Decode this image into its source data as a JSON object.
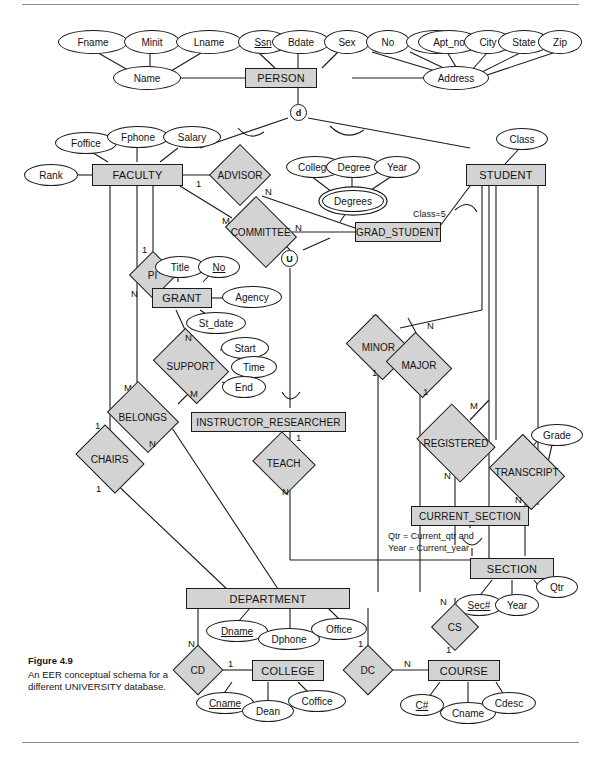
{
  "figure": {
    "number": "Figure 4.9",
    "caption": "An EER conceptual schema for a different UNIVERSITY database."
  },
  "entities": [
    {
      "id": "person",
      "label": "PERSON"
    },
    {
      "id": "faculty",
      "label": "FACULTY"
    },
    {
      "id": "student",
      "label": "STUDENT"
    },
    {
      "id": "grad",
      "label": "GRAD_STUDENT"
    },
    {
      "id": "grant",
      "label": "GRANT"
    },
    {
      "id": "instres",
      "label": "INSTRUCTOR_RESEARCHER"
    },
    {
      "id": "cursec",
      "label": "CURRENT_SECTION"
    },
    {
      "id": "section",
      "label": "SECTION"
    },
    {
      "id": "dept",
      "label": "DEPARTMENT"
    },
    {
      "id": "college",
      "label": "COLLEGE"
    },
    {
      "id": "course",
      "label": "COURSE"
    }
  ],
  "relationships": [
    {
      "id": "advisor",
      "label": "ADVISOR"
    },
    {
      "id": "committee",
      "label": "COMMITTEE"
    },
    {
      "id": "pi",
      "label": "PI"
    },
    {
      "id": "support",
      "label": "SUPPORT"
    },
    {
      "id": "belongs",
      "label": "BELONGS"
    },
    {
      "id": "chairs",
      "label": "CHAIRS"
    },
    {
      "id": "teach",
      "label": "TEACH"
    },
    {
      "id": "minor",
      "label": "MINOR"
    },
    {
      "id": "major",
      "label": "MAJOR"
    },
    {
      "id": "registered",
      "label": "REGISTERED"
    },
    {
      "id": "transcript",
      "label": "TRANSCRIPT"
    },
    {
      "id": "cd",
      "label": "CD"
    },
    {
      "id": "dc",
      "label": "DC"
    },
    {
      "id": "cs",
      "label": "CS"
    }
  ],
  "attributes": [
    {
      "id": "fname",
      "label": "Fname",
      "kind": "simple"
    },
    {
      "id": "minit",
      "label": "Minit",
      "kind": "simple"
    },
    {
      "id": "lname",
      "label": "Lname",
      "kind": "simple"
    },
    {
      "id": "name",
      "label": "Name",
      "kind": "composite"
    },
    {
      "id": "ssn",
      "label": "Ssn",
      "kind": "key"
    },
    {
      "id": "bdate",
      "label": "Bdate",
      "kind": "simple"
    },
    {
      "id": "sex",
      "label": "Sex",
      "kind": "simple"
    },
    {
      "id": "no",
      "label": "No",
      "kind": "simple"
    },
    {
      "id": "street",
      "label": "Street",
      "kind": "simple"
    },
    {
      "id": "apt_no",
      "label": "Apt_no",
      "kind": "simple"
    },
    {
      "id": "city",
      "label": "City",
      "kind": "simple"
    },
    {
      "id": "state",
      "label": "State",
      "kind": "simple"
    },
    {
      "id": "zip",
      "label": "Zip",
      "kind": "simple"
    },
    {
      "id": "address",
      "label": "Address",
      "kind": "composite"
    },
    {
      "id": "foffice",
      "label": "Foffice",
      "kind": "simple"
    },
    {
      "id": "fphone",
      "label": "Fphone",
      "kind": "simple"
    },
    {
      "id": "salary",
      "label": "Salary",
      "kind": "simple"
    },
    {
      "id": "rank",
      "label": "Rank",
      "kind": "simple"
    },
    {
      "id": "college_a",
      "label": "College",
      "kind": "simple"
    },
    {
      "id": "degree",
      "label": "Degree",
      "kind": "simple"
    },
    {
      "id": "year_d",
      "label": "Year",
      "kind": "simple"
    },
    {
      "id": "degrees",
      "label": "Degrees",
      "kind": "multivalued"
    },
    {
      "id": "class",
      "label": "Class",
      "kind": "simple"
    },
    {
      "id": "title",
      "label": "Title",
      "kind": "simple"
    },
    {
      "id": "gno",
      "label": "No",
      "kind": "key"
    },
    {
      "id": "agency",
      "label": "Agency",
      "kind": "simple"
    },
    {
      "id": "st_date",
      "label": "St_date",
      "kind": "simple"
    },
    {
      "id": "start",
      "label": "Start",
      "kind": "simple"
    },
    {
      "id": "time",
      "label": "Time",
      "kind": "simple"
    },
    {
      "id": "end",
      "label": "End",
      "kind": "simple"
    },
    {
      "id": "grade",
      "label": "Grade",
      "kind": "simple"
    },
    {
      "id": "sec_no",
      "label": "Sec#",
      "kind": "key"
    },
    {
      "id": "year_s",
      "label": "Year",
      "kind": "simple"
    },
    {
      "id": "qtr",
      "label": "Qtr",
      "kind": "simple"
    },
    {
      "id": "dname",
      "label": "Dname",
      "kind": "key"
    },
    {
      "id": "dphone",
      "label": "Dphone",
      "kind": "simple"
    },
    {
      "id": "office",
      "label": "Office",
      "kind": "simple"
    },
    {
      "id": "cname_col",
      "label": "Cname",
      "kind": "key"
    },
    {
      "id": "dean",
      "label": "Dean",
      "kind": "simple"
    },
    {
      "id": "coffice",
      "label": "Coffice",
      "kind": "simple"
    },
    {
      "id": "c_no",
      "label": "C#",
      "kind": "key"
    },
    {
      "id": "cname_crs",
      "label": "Cname",
      "kind": "simple"
    },
    {
      "id": "cdesc",
      "label": "Cdesc",
      "kind": "simple"
    }
  ],
  "specialization": {
    "disjoint_circle": "d",
    "union_circle": "U"
  },
  "constraints": [
    {
      "id": "class_eq",
      "text": "Class=5"
    },
    {
      "id": "cursec_cond_line1",
      "text": "Qtr = Current_qtr and"
    },
    {
      "id": "cursec_cond_line2",
      "text": "Year = Current_year"
    }
  ],
  "cardinalities": [
    {
      "id": "advisor_faculty",
      "text": "1"
    },
    {
      "id": "advisor_grad",
      "text": "N"
    },
    {
      "id": "committee_faculty",
      "text": "M"
    },
    {
      "id": "committee_grad",
      "text": "N"
    },
    {
      "id": "pi_faculty",
      "text": "1"
    },
    {
      "id": "pi_grant",
      "text": "N"
    },
    {
      "id": "support_grant",
      "text": "N"
    },
    {
      "id": "support_grad",
      "text": "M"
    },
    {
      "id": "belongs_faculty",
      "text": "M"
    },
    {
      "id": "belongs_dept",
      "text": "N"
    },
    {
      "id": "chairs_faculty",
      "text": "1"
    },
    {
      "id": "chairs_dept",
      "text": "1"
    },
    {
      "id": "teach_instres",
      "text": "1"
    },
    {
      "id": "teach_section",
      "text": "N"
    },
    {
      "id": "minor_student",
      "text": "N"
    },
    {
      "id": "minor_dept",
      "text": "1"
    },
    {
      "id": "major_student",
      "text": "N"
    },
    {
      "id": "major_dept",
      "text": "1"
    },
    {
      "id": "registered_top",
      "text": "M"
    },
    {
      "id": "registered_bottom",
      "text": "N"
    },
    {
      "id": "transcript_top",
      "text": "M"
    },
    {
      "id": "transcript_bottom",
      "text": "N"
    },
    {
      "id": "cd_dept",
      "text": "N"
    },
    {
      "id": "cd_college",
      "text": "1"
    },
    {
      "id": "dc_dept",
      "text": "1"
    },
    {
      "id": "dc_course",
      "text": "N"
    },
    {
      "id": "cs_section",
      "text": "N"
    },
    {
      "id": "cs_course",
      "text": "1"
    }
  ],
  "colors": {
    "shape_fill": "#d3d3d3",
    "attribute_fill": "#ffffff",
    "line": "#1b1b1b",
    "text": "#121212"
  }
}
